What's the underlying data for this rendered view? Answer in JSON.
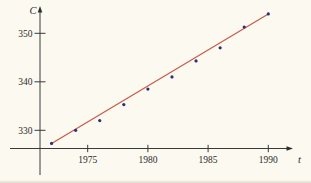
{
  "figure": {
    "background": "#fcf9f1",
    "axis_color": "#3a3a3a",
    "text_color": "#2b2b2b"
  },
  "chart_data": {
    "type": "scatter",
    "title": "",
    "xlabel": "t",
    "ylabel": "C",
    "x_ticks": [
      1975,
      1980,
      1985,
      1990
    ],
    "y_ticks": [
      330,
      340,
      350
    ],
    "xlim": [
      1971,
      1992
    ],
    "ylim": [
      326,
      357
    ],
    "grid": false,
    "legend": false,
    "series": [
      {
        "name": "co2-data-points",
        "type": "scatter",
        "color": "#2a2f77",
        "points": [
          [
            1972,
            327.3
          ],
          [
            1974,
            330.0
          ],
          [
            1976,
            332.0
          ],
          [
            1978,
            335.3
          ],
          [
            1980,
            338.5
          ],
          [
            1982,
            341.0
          ],
          [
            1984,
            344.3
          ],
          [
            1986,
            347.0
          ],
          [
            1988,
            351.3
          ],
          [
            1990,
            354.0
          ]
        ]
      },
      {
        "name": "linear-model-line",
        "type": "line",
        "color": "#c75b47",
        "points": [
          [
            1972,
            327.3
          ],
          [
            1990,
            354.0
          ]
        ]
      }
    ]
  }
}
